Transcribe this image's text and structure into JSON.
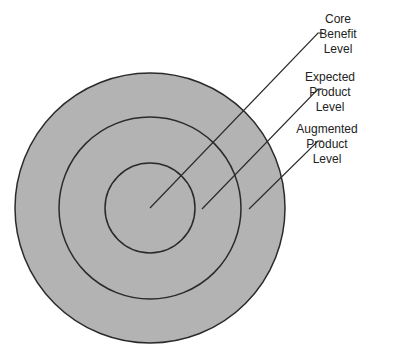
{
  "diagram": {
    "title": "",
    "fill_color": "#b3b3b3",
    "stroke_color": "#2a2a2a",
    "levels": [
      {
        "label_lines": [
          "Core",
          "Benefit",
          "Level"
        ]
      },
      {
        "label_lines": [
          "Expected",
          "Product",
          "Level"
        ]
      },
      {
        "label_lines": [
          "Augmented",
          "Product",
          "Level"
        ]
      }
    ]
  }
}
